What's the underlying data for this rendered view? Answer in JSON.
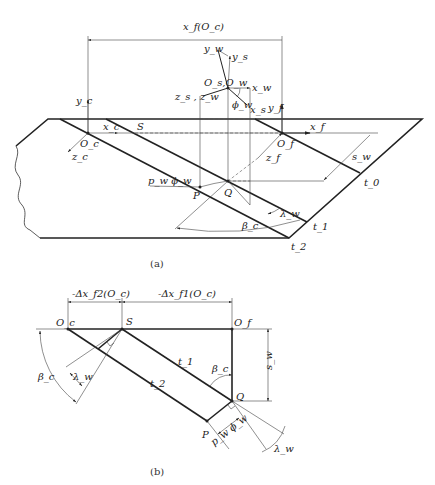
{
  "figure_a": {
    "caption": "(a)",
    "labels": {
      "xf_Oc": "x_f(O_c)",
      "yw": "y_w",
      "ys": "y_s",
      "Os_Ow": "O_s,O_w",
      "xw": "x_w",
      "zs_zw": "z_s , z_w",
      "phi_w": "ϕ_w",
      "xs": "x_s",
      "yc": "y_c",
      "yf": "y_f",
      "xc": "x_c",
      "S": "S",
      "xf": "x_f",
      "Oc": "O_c",
      "Of": "O_f",
      "zc": "z_c",
      "zf": "z_f",
      "sw": "s_w",
      "t0": "t_0",
      "pw_phiw": "p_w ϕ_w",
      "P": "P",
      "Q": "Q",
      "lambda_w": "λ_w",
      "t1": "t_1",
      "beta_c": "β_c",
      "t2": "t_2"
    }
  },
  "figure_b": {
    "caption": "(b)",
    "labels": {
      "dxf2": "-Δx_f2(O_c)",
      "dxf1": "-Δx_f1(O_c)",
      "Oc": "O_c",
      "S": "S",
      "Of": "O_f",
      "t1": "t_1",
      "t2": "t_2",
      "beta_c_left": "β_c",
      "beta_c_right": "β_c",
      "lambda_w_left": "λ_w",
      "lambda_w_right": "λ_w",
      "sw": "s_w",
      "Q": "Q",
      "P": "P",
      "pw_phiw": "p_w ϕ_w"
    }
  }
}
